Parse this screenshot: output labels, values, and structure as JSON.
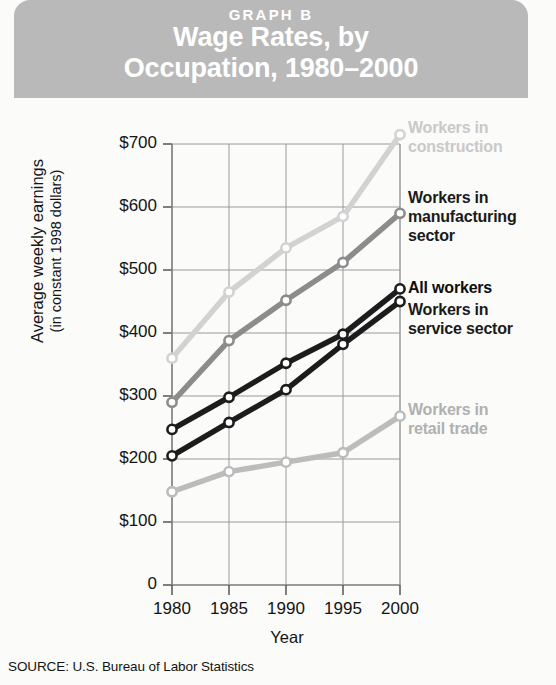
{
  "header": {
    "graph_label": "GRAPH B",
    "title_line1": "Wage Rates, by",
    "title_line2": "Occupation, 1980–2000",
    "band_color": "#b9b9b9",
    "text_color": "#ffffff"
  },
  "source": "SOURCE: U.S. Bureau of Labor Statistics",
  "axis": {
    "ylabel_line1": "Average weekly earnings",
    "ylabel_line2": "(in constant 1998 dollars)",
    "xlabel": "Year"
  },
  "legend": {
    "construction_line1": "Workers in",
    "construction_line2": "construction",
    "manufacturing_line1": "Workers in",
    "manufacturing_line2": "manufacturing",
    "manufacturing_line3": "sector",
    "all_workers": "All workers",
    "service_line1": "Workers in",
    "service_line2": "service sector",
    "retail_line1": "Workers in",
    "retail_line2": "retail trade"
  },
  "chart_data": {
    "type": "line",
    "title": "Wage Rates, by Occupation, 1980–2000",
    "subtitle": "GRAPH B",
    "xlabel": "Year",
    "ylabel": "Average weekly earnings (in constant 1998 dollars)",
    "source": "SOURCE: U.S. Bureau of Labor Statistics",
    "categories": [
      1980,
      1985,
      1990,
      1995,
      2000
    ],
    "x_tick_labels": [
      "1980",
      "1985",
      "1990",
      "1995",
      "2000"
    ],
    "y_tick_labels": [
      "0",
      "$100",
      "$200",
      "$300",
      "$400",
      "$500",
      "$600",
      "$700"
    ],
    "y_tick_values": [
      0,
      100,
      200,
      300,
      400,
      500,
      600,
      700
    ],
    "ylim": [
      0,
      700
    ],
    "grid": true,
    "legend_position": "right",
    "series": [
      {
        "name": "Workers in construction",
        "color": "#d2d2d2",
        "marker": "circle",
        "values": [
          360,
          465,
          535,
          585,
          715
        ]
      },
      {
        "name": "Workers in manufacturing sector",
        "color": "#8c8c8c",
        "marker": "circle",
        "values": [
          290,
          388,
          452,
          512,
          590
        ]
      },
      {
        "name": "All workers",
        "color": "#1c1c1c",
        "marker": "circle",
        "values": [
          247,
          298,
          352,
          398,
          470
        ]
      },
      {
        "name": "Workers in service sector",
        "color": "#1c1c1c",
        "marker": "circle",
        "values": [
          205,
          258,
          310,
          382,
          450
        ]
      },
      {
        "name": "Workers in retail trade",
        "color": "#bcbcbc",
        "marker": "circle",
        "values": [
          148,
          180,
          195,
          210,
          268
        ]
      }
    ]
  }
}
